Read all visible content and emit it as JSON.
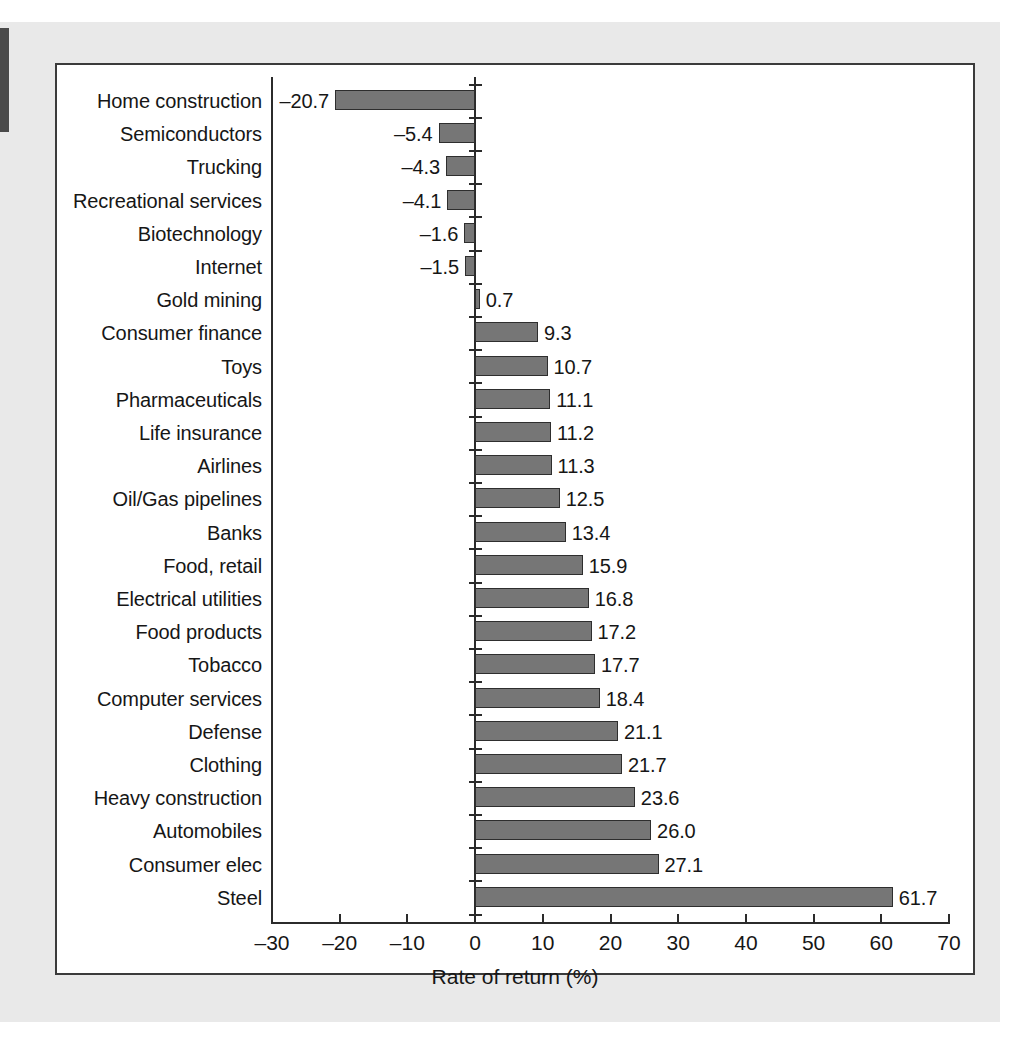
{
  "figure": {
    "background_color": "#e9e9e9",
    "panel_color": "#ffffff",
    "border_color": "#3b3b3b",
    "bar_fill_color": "#767676",
    "bar_edge_color": "#2e2e2e",
    "axis_color": "#2b2b2b",
    "text_color": "#161616"
  },
  "chart_data": {
    "type": "bar",
    "orientation": "horizontal",
    "title": "",
    "subtitle": "",
    "xlabel": "Rate of return (%)",
    "ylabel": "",
    "xlim": [
      -30,
      70
    ],
    "xticks": [
      -30,
      -20,
      -10,
      0,
      10,
      20,
      30,
      40,
      50,
      60,
      70
    ],
    "xtick_labels": [
      "–30",
      "–20",
      "–10",
      "0",
      "10",
      "20",
      "30",
      "40",
      "50",
      "60",
      "70"
    ],
    "grid": false,
    "legend": null,
    "data_labels": true,
    "categories": [
      "Home construction",
      "Semiconductors",
      "Trucking",
      "Recreational services",
      "Biotechnology",
      "Internet",
      "Gold mining",
      "Consumer finance",
      "Toys",
      "Pharmaceuticals",
      "Life insurance",
      "Airlines",
      "Oil/Gas pipelines",
      "Banks",
      "Food, retail",
      "Electrical utilities",
      "Food products",
      "Tobacco",
      "Computer services",
      "Defense",
      "Clothing",
      "Heavy construction",
      "Automobiles",
      "Consumer elec",
      "Steel"
    ],
    "values": [
      -20.7,
      -5.4,
      -4.3,
      -4.1,
      -1.6,
      -1.5,
      0.7,
      9.3,
      10.7,
      11.1,
      11.2,
      11.3,
      12.5,
      13.4,
      15.9,
      16.8,
      17.2,
      17.7,
      18.4,
      21.1,
      21.7,
      23.6,
      26.0,
      27.1,
      61.7
    ],
    "value_labels": [
      "–20.7",
      "–5.4",
      "–4.3",
      "–4.1",
      "–1.6",
      "–1.5",
      "0.7",
      "9.3",
      "10.7",
      "11.1",
      "11.2",
      "11.3",
      "12.5",
      "13.4",
      "15.9",
      "16.8",
      "17.2",
      "17.7",
      "18.4",
      "21.1",
      "21.7",
      "23.6",
      "26.0",
      "27.1",
      "61.7"
    ]
  }
}
